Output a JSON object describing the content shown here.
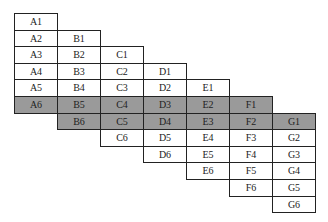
{
  "diagram": {
    "columns": [
      "A",
      "B",
      "C",
      "D",
      "E",
      "F",
      "G"
    ],
    "layout": {
      "left": 14,
      "top": 13,
      "col_width": 43,
      "row_height": 16.6
    },
    "shaded_color": "#9a9a9a",
    "cells": [
      {
        "label": "A1",
        "col": 0,
        "row": 0,
        "shaded": false
      },
      {
        "label": "A2",
        "col": 0,
        "row": 1,
        "shaded": false
      },
      {
        "label": "A3",
        "col": 0,
        "row": 2,
        "shaded": false
      },
      {
        "label": "A4",
        "col": 0,
        "row": 3,
        "shaded": false
      },
      {
        "label": "A5",
        "col": 0,
        "row": 4,
        "shaded": false
      },
      {
        "label": "A6",
        "col": 0,
        "row": 5,
        "shaded": true
      },
      {
        "label": "B1",
        "col": 1,
        "row": 1,
        "shaded": false
      },
      {
        "label": "B2",
        "col": 1,
        "row": 2,
        "shaded": false
      },
      {
        "label": "B3",
        "col": 1,
        "row": 3,
        "shaded": false
      },
      {
        "label": "B4",
        "col": 1,
        "row": 4,
        "shaded": false
      },
      {
        "label": "B5",
        "col": 1,
        "row": 5,
        "shaded": true
      },
      {
        "label": "B6",
        "col": 1,
        "row": 6,
        "shaded": true
      },
      {
        "label": "C1",
        "col": 2,
        "row": 2,
        "shaded": false
      },
      {
        "label": "C2",
        "col": 2,
        "row": 3,
        "shaded": false
      },
      {
        "label": "C3",
        "col": 2,
        "row": 4,
        "shaded": false
      },
      {
        "label": "C4",
        "col": 2,
        "row": 5,
        "shaded": true
      },
      {
        "label": "C5",
        "col": 2,
        "row": 6,
        "shaded": true
      },
      {
        "label": "C6",
        "col": 2,
        "row": 7,
        "shaded": false
      },
      {
        "label": "D1",
        "col": 3,
        "row": 3,
        "shaded": false
      },
      {
        "label": "D2",
        "col": 3,
        "row": 4,
        "shaded": false
      },
      {
        "label": "D3",
        "col": 3,
        "row": 5,
        "shaded": true
      },
      {
        "label": "D4",
        "col": 3,
        "row": 6,
        "shaded": true
      },
      {
        "label": "D5",
        "col": 3,
        "row": 7,
        "shaded": false
      },
      {
        "label": "D6",
        "col": 3,
        "row": 8,
        "shaded": false
      },
      {
        "label": "E1",
        "col": 4,
        "row": 4,
        "shaded": false
      },
      {
        "label": "E2",
        "col": 4,
        "row": 5,
        "shaded": true
      },
      {
        "label": "E3",
        "col": 4,
        "row": 6,
        "shaded": true
      },
      {
        "label": "E4",
        "col": 4,
        "row": 7,
        "shaded": false
      },
      {
        "label": "E5",
        "col": 4,
        "row": 8,
        "shaded": false
      },
      {
        "label": "E6",
        "col": 4,
        "row": 9,
        "shaded": false
      },
      {
        "label": "F1",
        "col": 5,
        "row": 5,
        "shaded": true
      },
      {
        "label": "F2",
        "col": 5,
        "row": 6,
        "shaded": true
      },
      {
        "label": "F3",
        "col": 5,
        "row": 7,
        "shaded": false
      },
      {
        "label": "F4",
        "col": 5,
        "row": 8,
        "shaded": false
      },
      {
        "label": "F5",
        "col": 5,
        "row": 9,
        "shaded": false
      },
      {
        "label": "F6",
        "col": 5,
        "row": 10,
        "shaded": false
      },
      {
        "label": "G1",
        "col": 6,
        "row": 6,
        "shaded": true
      },
      {
        "label": "G2",
        "col": 6,
        "row": 7,
        "shaded": false
      },
      {
        "label": "G3",
        "col": 6,
        "row": 8,
        "shaded": false
      },
      {
        "label": "G4",
        "col": 6,
        "row": 9,
        "shaded": false
      },
      {
        "label": "G5",
        "col": 6,
        "row": 10,
        "shaded": false
      },
      {
        "label": "G6",
        "col": 6,
        "row": 11,
        "shaded": false
      }
    ]
  }
}
